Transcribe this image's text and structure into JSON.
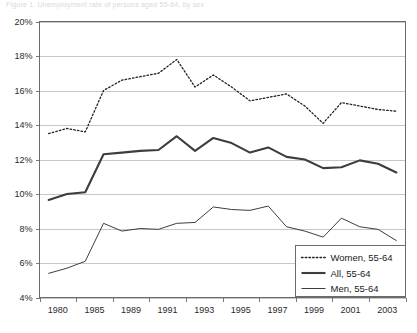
{
  "caption": {
    "text": "Figure 1. Unemployment rate of persons aged 55-64, by sex"
  },
  "chart_data": {
    "type": "line",
    "title": "",
    "subtitle": "",
    "xlabel": "",
    "ylabel": "",
    "grid": true,
    "legend_position": "bottom-right",
    "ylim": [
      4,
      20
    ],
    "y_tick_labels": [
      "20%",
      "18%",
      "16%",
      "14%",
      "12%",
      "10%",
      "8%",
      "6%",
      "4%"
    ],
    "y_tick_values": [
      20,
      18,
      16,
      14,
      12,
      10,
      8,
      6,
      4
    ],
    "x_tick_labels": [
      "1980",
      "1985",
      "1989",
      "1991",
      "1993",
      "1995",
      "1997",
      "1999",
      "2001",
      "2003"
    ],
    "categories": [
      "1980",
      "1982",
      "1985",
      "1987",
      "1989",
      "1990",
      "1991",
      "1992",
      "1993",
      "1994",
      "1995",
      "1996",
      "1997",
      "1998",
      "1999",
      "2000",
      "2001",
      "2002",
      "2003",
      "2004"
    ],
    "series": [
      {
        "name": "Women, 55-64",
        "style": "dotted",
        "color": "#222222",
        "width": 1.3,
        "values": [
          13.5,
          13.8,
          13.6,
          16.0,
          16.6,
          16.8,
          17.0,
          17.8,
          16.2,
          16.9,
          16.2,
          15.4,
          15.6,
          15.8,
          15.1,
          14.1,
          15.3,
          15.1,
          14.9,
          14.8
        ]
      },
      {
        "name": "All, 55-64",
        "style": "solid-thick",
        "color": "#3d3d3d",
        "width": 2.1,
        "values": [
          9.65,
          10.0,
          10.1,
          12.3,
          12.4,
          12.5,
          12.55,
          13.35,
          12.5,
          13.25,
          12.95,
          12.4,
          12.7,
          12.15,
          12.0,
          11.5,
          11.55,
          11.95,
          11.75,
          11.25
        ]
      },
      {
        "name": "Men, 55-64",
        "style": "solid-thin",
        "color": "#3d3d3d",
        "width": 1.0,
        "values": [
          5.4,
          5.7,
          6.1,
          8.3,
          7.85,
          8.0,
          7.95,
          8.3,
          8.35,
          9.25,
          9.1,
          9.05,
          9.3,
          8.1,
          7.85,
          7.5,
          8.6,
          8.1,
          7.95,
          7.3
        ]
      }
    ]
  },
  "legend": {
    "entries": [
      {
        "label": "Women, 55-64",
        "style": "dotted"
      },
      {
        "label": "All, 55-64",
        "style": "solid-thick"
      },
      {
        "label": "Men, 55-64",
        "style": "solid-thin"
      }
    ]
  }
}
